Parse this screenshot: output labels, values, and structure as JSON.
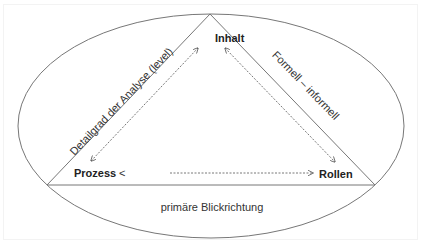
{
  "diagram": {
    "nodes": {
      "top": "Inhalt",
      "left": "Prozess",
      "left_suffix": "<",
      "right": "Rollen"
    },
    "edge_labels": {
      "left_side": "Detailgrad der Analyse (level)",
      "right_side": "Formell – informell",
      "bottom": "primäre Blickrichtung"
    },
    "arrows": [
      {
        "from": "Prozess",
        "to": "Inhalt",
        "style": "dashed",
        "direction": "both"
      },
      {
        "from": "Inhalt",
        "to": "Rollen",
        "style": "dashed",
        "direction": "both"
      },
      {
        "from": "Prozess",
        "to": "Rollen",
        "style": "dashed",
        "direction": "forward"
      }
    ],
    "colors": {
      "stroke": "#777777",
      "text": "#222222",
      "background": "#ffffff"
    }
  }
}
